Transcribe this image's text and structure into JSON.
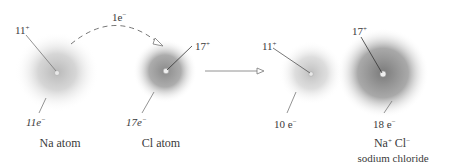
{
  "diagram": {
    "transfer": {
      "label": "1e",
      "label_sup": "−"
    },
    "reactants": [
      {
        "name": "Na atom",
        "nucleus_charge": "11",
        "nucleus_sign": "+",
        "electrons": "11e",
        "electrons_sign": "−",
        "cloud_color": "#b8b8b8"
      },
      {
        "name": "Cl atom",
        "nucleus_charge": "17",
        "nucleus_sign": "+",
        "electrons": "17e",
        "electrons_sign": "−",
        "cloud_color": "#7a7a7a"
      }
    ],
    "products": [
      {
        "nucleus_charge": "11",
        "nucleus_sign": "+",
        "electrons": "10 e",
        "electrons_sign": "−",
        "cloud_color": "#bdbdbd"
      },
      {
        "nucleus_charge": "17",
        "nucleus_sign": "+",
        "electrons": "18 e",
        "electrons_sign": "−",
        "cloud_color": "#6e6e6e"
      }
    ],
    "product_formula": {
      "na": "Na",
      "na_sign": "+",
      "cl": "Cl",
      "cl_sign": "−"
    },
    "product_name": "sodium chloride"
  }
}
